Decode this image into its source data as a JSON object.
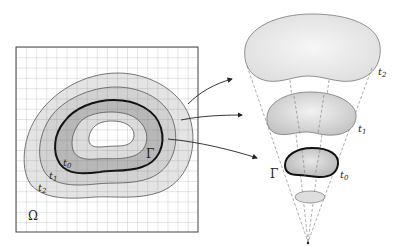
{
  "figure": {
    "left_panel": {
      "domain_label": "Ω",
      "front_label": "Γ",
      "contour_labels": [
        {
          "base": "t",
          "sub": "0"
        },
        {
          "base": "t",
          "sub": "1"
        },
        {
          "base": "t",
          "sub": "2"
        }
      ]
    },
    "right_panel": {
      "front_label": "Γ",
      "level_labels": [
        {
          "base": "t",
          "sub": "2"
        },
        {
          "base": "t",
          "sub": "1"
        },
        {
          "base": "t",
          "sub": "0"
        }
      ]
    },
    "colors": {
      "grid": "#555555",
      "ring_outer": "#e6e6e6",
      "ring_mid": "#d3d3d3",
      "ring_inner": "#b9b9b9",
      "ring_core": "#dcdcdc",
      "center": "#ffffff",
      "front": "#111111",
      "contour": "#666666",
      "dash": "#777777"
    }
  }
}
